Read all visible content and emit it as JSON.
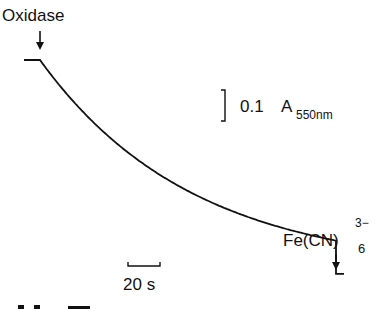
{
  "figure": {
    "annotations": {
      "oxidase_label": "Oxidase",
      "ferricyanide_base": "Fe(CN)",
      "ferricyanide_subscript": "6",
      "ferricyanide_superscript": "3−",
      "absorbance_scale_value": "0.1",
      "absorbance_scale_unit": "A",
      "absorbance_scale_subscript": "550nm",
      "time_scale_label": "20 s"
    },
    "caption_fragment": "",
    "colors": {
      "trace": "#111111",
      "background": "#ffffff"
    }
  },
  "chart_data": {
    "type": "line",
    "title": "",
    "xlabel": "",
    "ylabel": "",
    "scale_bars": {
      "absorbance": {
        "value": 0.1,
        "unit": "A550nm"
      },
      "time": {
        "value": 20,
        "unit": "s"
      }
    },
    "x_unit": "s",
    "y_unit": "ΔA550",
    "events": [
      {
        "label": "Oxidase",
        "time_s": 0
      },
      {
        "label": "Fe(CN)6 3−",
        "time_s": 185
      }
    ],
    "series": [
      {
        "name": "A550 trace",
        "x": [
          -10,
          0,
          20,
          40,
          60,
          80,
          100,
          120,
          140,
          160,
          185,
          185,
          190
        ],
        "y": [
          0,
          0,
          -0.14,
          -0.26,
          -0.35,
          -0.42,
          -0.47,
          -0.51,
          -0.54,
          -0.56,
          -0.58,
          -0.69,
          -0.69
        ]
      }
    ]
  }
}
